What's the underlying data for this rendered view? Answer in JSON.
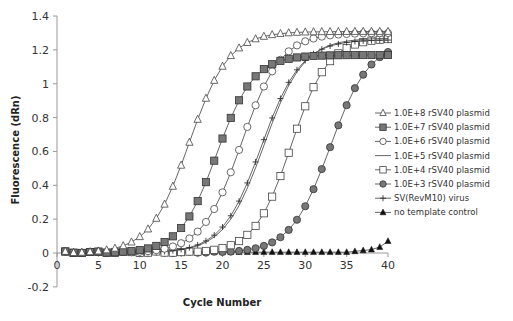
{
  "chart_data": {
    "type": "line",
    "title": "",
    "xlabel": "Cycle Number",
    "ylabel": "Fluorescence (dRn)",
    "xlim": [
      0,
      40
    ],
    "ylim": [
      -0.2,
      1.4
    ],
    "xticks": [
      0,
      5,
      10,
      15,
      20,
      25,
      30,
      35,
      40
    ],
    "yticks": [
      -0.2,
      0,
      0.2,
      0.4,
      0.6,
      0.8,
      1,
      1.2,
      1.4
    ],
    "ytick_labels": [
      "-0.2",
      "0",
      "0.2",
      "0.4",
      "0.6",
      "0.8",
      "1",
      "1.2",
      "1.4"
    ],
    "grid": false,
    "legend_position": "right",
    "x": [
      1,
      2,
      3,
      4,
      5,
      6,
      7,
      8,
      9,
      10,
      11,
      12,
      13,
      14,
      15,
      16,
      17,
      18,
      19,
      20,
      21,
      22,
      23,
      24,
      25,
      26,
      27,
      28,
      29,
      30,
      31,
      32,
      33,
      34,
      35,
      36,
      37,
      38,
      39,
      40
    ],
    "series": [
      {
        "name": "1.0E+8 rSV40 plasmid",
        "marker": "open-triangle",
        "plateau": 1.31,
        "midpoint": 16.0,
        "slope": 0.42
      },
      {
        "name": "1.0E+7 rSV40 plasmid",
        "marker": "filled-square",
        "plateau": 1.17,
        "midpoint": 19.3,
        "slope": 0.45
      },
      {
        "name": "1.0E+6 rSV40 plasmid",
        "marker": "open-circle",
        "plateau": 1.3,
        "midpoint": 22.3,
        "slope": 0.42
      },
      {
        "name": "1.0E+5 rSV40 plasmid",
        "marker": "none",
        "plateau": 1.27,
        "midpoint": 25.0,
        "slope": 0.42
      },
      {
        "name": "1.0E+4 rSV40 plasmid",
        "marker": "open-square",
        "plateau": 1.27,
        "midpoint": 28.3,
        "slope": 0.45
      },
      {
        "name": "1.0E+3 rSV40 plasmid",
        "marker": "filled-circle",
        "plateau": 1.25,
        "midpoint": 33.0,
        "slope": 0.42
      },
      {
        "name": "SV(RevM10) virus",
        "marker": "plus",
        "plateau": 1.26,
        "midpoint": 24.7,
        "slope": 0.42
      },
      {
        "name": "no template control",
        "marker": "filled-triangle",
        "plateau": 0.0,
        "midpoint": 0,
        "slope": 0,
        "values_tail": {
          "36": 0.01,
          "37": 0.015,
          "38": 0.02,
          "39": 0.035,
          "40": 0.07
        }
      }
    ]
  },
  "legend": {
    "items": [
      "1.0E+8 rSV40 plasmid",
      "1.0E+7 rSV40 plasmid",
      "1.0E+6 rSV40 plasmid",
      "1.0E+5 rSV40 plasmid",
      "1.0E+4 rSV40 plasmid",
      "1.0E+3 rSV40 plasmid",
      "SV(RevM10) virus",
      "no template control"
    ]
  },
  "colors": {
    "axis": "#999999",
    "line": "#555555",
    "filled_marker": "#777777",
    "black_marker": "#111111"
  }
}
